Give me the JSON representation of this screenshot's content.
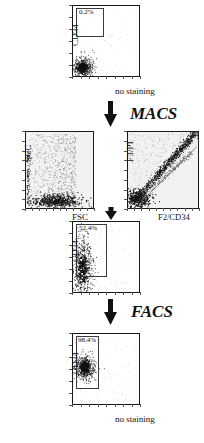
{
  "figure": {
    "kind": "flow-cytometry-workflow",
    "background_color": "#ffffff",
    "ink_color": "#111111"
  },
  "chart_data": [
    {
      "id": "panel-pre-macs",
      "type": "scatter",
      "title": "",
      "xlabel": "no staining",
      "ylabel": "CD34",
      "gate_label": "0.2%",
      "gate_percent": 0.2,
      "xlim": [
        0,
        100
      ],
      "ylim": [
        0,
        100
      ],
      "grid": false,
      "gate_rect": {
        "x": 6,
        "y": 55,
        "w": 40,
        "h": 40
      },
      "cluster": {
        "cx": 16,
        "cy": 13,
        "sx": 7,
        "sy": 7,
        "n": 520
      },
      "sparse": {
        "n": 60
      }
    },
    {
      "id": "panel-scc-fsc",
      "type": "scatter",
      "title": "",
      "xlabel": "FSC",
      "ylabel": "SCC",
      "gate_label": "",
      "xlim": [
        0,
        100
      ],
      "ylim": [
        0,
        100
      ],
      "grid": false,
      "cluster": {
        "cx": 45,
        "cy": 10,
        "sx": 18,
        "sy": 4,
        "n": 520
      },
      "sparse": {
        "n": 900
      }
    },
    {
      "id": "panel-f3pi-f2cd34",
      "type": "scatter",
      "title": "",
      "xlabel": "F2/CD34",
      "ylabel": "F3/PI",
      "gate_label": "",
      "xlim": [
        0,
        100
      ],
      "ylim": [
        0,
        100
      ],
      "grid": false,
      "diagonal": true,
      "cluster": {
        "cx": 16,
        "cy": 13,
        "sx": 9,
        "sy": 6,
        "n": 420
      },
      "sparse": {
        "n": 700
      }
    },
    {
      "id": "panel-post-macs",
      "type": "scatter",
      "title": "",
      "xlabel": "",
      "ylabel": "CD34",
      "gate_label": "52.4%",
      "gate_percent": 52.4,
      "xlim": [
        0,
        100
      ],
      "ylim": [
        0,
        100
      ],
      "grid": false,
      "gate_rect": {
        "x": 6,
        "y": 22,
        "w": 44,
        "h": 73
      },
      "cluster": {
        "cx": 16,
        "cy": 32,
        "sx": 7,
        "sy": 22,
        "n": 620
      },
      "sparse": {
        "n": 90
      }
    },
    {
      "id": "panel-post-facs",
      "type": "scatter",
      "title": "",
      "xlabel": "no staining",
      "ylabel": "CD34",
      "gate_label": "98.4%",
      "gate_percent": 98.4,
      "xlim": [
        0,
        100
      ],
      "ylim": [
        0,
        100
      ],
      "grid": false,
      "gate_rect": {
        "x": 6,
        "y": 22,
        "w": 33,
        "h": 73
      },
      "cluster": {
        "cx": 19,
        "cy": 52,
        "sx": 7,
        "sy": 8,
        "n": 560
      },
      "sparse": {
        "n": 70
      }
    }
  ],
  "panels": {
    "pre_macs": {
      "ylabel": "CD34",
      "xlabel": "no staining",
      "gate_label": "0.2%"
    },
    "scc_fsc": {
      "ylabel": "SCC",
      "xlabel": "FSC"
    },
    "f3pi": {
      "ylabel": "F3/PI",
      "xlabel": "F2/CD34"
    },
    "post_macs": {
      "ylabel": "CD34",
      "gate_label": "52.4%"
    },
    "post_facs": {
      "ylabel": "CD34",
      "xlabel": "no staining",
      "gate_label": "98.4%"
    }
  },
  "steps": {
    "macs": "MACS",
    "facs": "FACS"
  }
}
